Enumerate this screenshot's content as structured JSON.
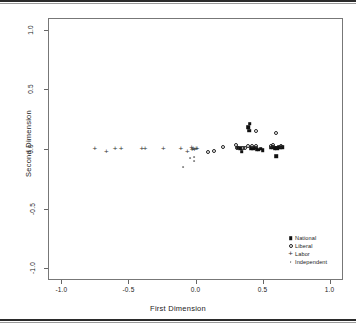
{
  "chart_data": {
    "type": "scatter",
    "title": "",
    "xlabel": "First Dimension",
    "ylabel": "Second Dimension",
    "xlim": [
      -1.1,
      1.1
    ],
    "ylim": [
      -1.1,
      1.1
    ],
    "xticks": [
      "-1.0",
      "-0.5",
      "0.0",
      "0.5",
      "1.0"
    ],
    "xtick_values": [
      -1.0,
      -0.5,
      0.0,
      0.5,
      1.0
    ],
    "yticks": [
      "-1.0",
      "-0.5",
      "0.0",
      "0.5",
      "1.0"
    ],
    "ytick_values": [
      -1.0,
      -0.5,
      0.0,
      0.5,
      1.0
    ],
    "grid": false,
    "legend_position": "bottom-right",
    "series": [
      {
        "name": "National",
        "marker": "filled-square",
        "marker_name": "filled-square-marker",
        "color": "#111111",
        "points": [
          [
            0.315,
            0.012
          ],
          [
            0.335,
            0.005
          ],
          [
            0.345,
            -0.022
          ],
          [
            0.395,
            0.185
          ],
          [
            0.4,
            0.155
          ],
          [
            0.405,
            0.212
          ],
          [
            0.415,
            0.008
          ],
          [
            0.43,
            0.002
          ],
          [
            0.445,
            0.01
          ],
          [
            0.455,
            0.0
          ],
          [
            0.47,
            -0.005
          ],
          [
            0.485,
            0.002
          ],
          [
            0.5,
            -0.008
          ],
          [
            0.56,
            0.01
          ],
          [
            0.575,
            0.015
          ],
          [
            0.59,
            0.008
          ],
          [
            0.6,
            0.012
          ],
          [
            0.61,
            0.005
          ],
          [
            0.62,
            0.018
          ],
          [
            0.632,
            0.01
          ],
          [
            0.645,
            0.014
          ],
          [
            0.6,
            -0.06
          ]
        ]
      },
      {
        "name": "Liberal",
        "marker": "open-circle",
        "marker_name": "open-circle-marker",
        "color": "#222222",
        "points": [
          [
            0.09,
            -0.028
          ],
          [
            0.135,
            -0.018
          ],
          [
            0.205,
            0.018
          ],
          [
            0.3,
            0.03
          ],
          [
            0.31,
            0.012
          ],
          [
            0.355,
            0.012
          ],
          [
            0.37,
            0.008
          ],
          [
            0.395,
            0.028
          ],
          [
            0.42,
            0.025
          ],
          [
            0.448,
            0.022
          ],
          [
            0.452,
            0.15
          ],
          [
            0.56,
            0.028
          ],
          [
            0.575,
            0.03
          ],
          [
            0.6,
            0.135
          ],
          [
            0.64,
            0.022
          ]
        ]
      },
      {
        "name": "Labor",
        "marker": "plus",
        "marker_name": "plus-marker",
        "color": "#333333",
        "points": [
          [
            -0.75,
            0.01
          ],
          [
            -0.665,
            -0.02
          ],
          [
            -0.6,
            0.008
          ],
          [
            -0.555,
            0.01
          ],
          [
            -0.4,
            0.008
          ],
          [
            -0.375,
            0.008
          ],
          [
            -0.24,
            0.01
          ],
          [
            -0.11,
            0.008
          ],
          [
            -0.06,
            -0.02
          ],
          [
            -0.03,
            0.02
          ],
          [
            -0.025,
            0.0
          ],
          [
            -0.018,
            0.01
          ],
          [
            -0.008,
            -0.002
          ],
          [
            0.005,
            0.008
          ],
          [
            0.012,
            0.006
          ]
        ]
      },
      {
        "name": "Independent",
        "marker": "small-dot",
        "marker_name": "small-dot-marker",
        "color": "#8a8a8a",
        "points": [
          [
            -0.095,
            -0.155
          ],
          [
            -0.04,
            -0.075
          ],
          [
            -0.012,
            -0.1
          ],
          [
            -0.01,
            -0.065
          ]
        ]
      }
    ],
    "legend": [
      {
        "label": "National",
        "marker": "filled-square"
      },
      {
        "label": "Liberal",
        "marker": "open-circle"
      },
      {
        "label": "Labor",
        "marker": "plus"
      },
      {
        "label": "Independent",
        "marker": "small-dot"
      }
    ]
  }
}
